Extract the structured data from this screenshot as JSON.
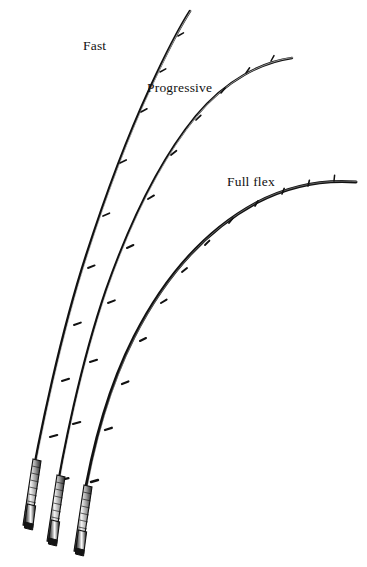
{
  "figure": {
    "background_color": "#ffffff",
    "ink_color": "#111111",
    "medium": "monochrome pen-and-ink line illustration"
  },
  "labels": {
    "fast": "Fast",
    "progressive": "Progressive",
    "full_flex": "Full flex"
  },
  "rods": [
    {
      "id": "fast",
      "label": "Fast",
      "description": "bend concentrated in the upper third, near-straight butt section",
      "butt_x": 22,
      "butt_y": 527,
      "tip_x": 190,
      "tip_y": 10,
      "blank_path": "M 26 512 C 40 430 62 330 86 256 C 106 194 126 140 150 88 C 163 60 176 33 190 11",
      "guide_positions": [
        {
          "x": 178,
          "y": 36
        },
        {
          "x": 160,
          "y": 72
        },
        {
          "x": 141,
          "y": 112
        },
        {
          "x": 120,
          "y": 163
        },
        {
          "x": 103,
          "y": 216
        },
        {
          "x": 88,
          "y": 268
        },
        {
          "x": 74,
          "y": 325
        },
        {
          "x": 62,
          "y": 381
        },
        {
          "x": 50,
          "y": 437
        }
      ],
      "grip": {
        "top_x": 36,
        "top_y": 462,
        "bottom_x": 22,
        "bottom_y": 527,
        "type": "cork-grip-with-reel-seat"
      }
    },
    {
      "id": "progressive",
      "label": "Progressive",
      "description": "even bend through the middle of the blank",
      "butt_x": 47,
      "butt_y": 543,
      "tip_x": 292,
      "tip_y": 57,
      "blank_path": "M 51 527 C 62 452 82 360 106 290 C 130 222 160 160 196 116 C 226 80 262 62 292 58",
      "guide_positions": [
        {
          "x": 271,
          "y": 61
        },
        {
          "x": 246,
          "y": 73
        },
        {
          "x": 221,
          "y": 93
        },
        {
          "x": 196,
          "y": 120
        },
        {
          "x": 171,
          "y": 155
        },
        {
          "x": 148,
          "y": 199
        },
        {
          "x": 127,
          "y": 248
        },
        {
          "x": 108,
          "y": 303
        },
        {
          "x": 90,
          "y": 362
        },
        {
          "x": 73,
          "y": 424
        },
        {
          "x": 61,
          "y": 480
        }
      ],
      "grip": {
        "top_x": 60,
        "top_y": 478,
        "bottom_x": 47,
        "bottom_y": 543,
        "type": "cork-grip-with-reel-seat"
      }
    },
    {
      "id": "full-flex",
      "label": "Full flex",
      "description": "continuous arc bending from the grip right through to the tip",
      "butt_x": 74,
      "butt_y": 553,
      "tip_x": 356,
      "tip_y": 182,
      "blank_path": "M 78 536 C 88 462 106 392 134 337 C 166 274 208 229 256 203 C 292 184 328 180 356 182",
      "guide_positions": [
        {
          "x": 334,
          "y": 181
        },
        {
          "x": 308,
          "y": 186
        },
        {
          "x": 282,
          "y": 194
        },
        {
          "x": 255,
          "y": 206
        },
        {
          "x": 229,
          "y": 223
        },
        {
          "x": 205,
          "y": 245
        },
        {
          "x": 182,
          "y": 272
        },
        {
          "x": 161,
          "y": 303
        },
        {
          "x": 140,
          "y": 341
        },
        {
          "x": 122,
          "y": 384
        },
        {
          "x": 105,
          "y": 430
        },
        {
          "x": 91,
          "y": 482
        }
      ],
      "grip": {
        "top_x": 86,
        "top_y": 488,
        "bottom_x": 74,
        "bottom_y": 553,
        "type": "cork-grip-with-reel-seat"
      }
    }
  ]
}
